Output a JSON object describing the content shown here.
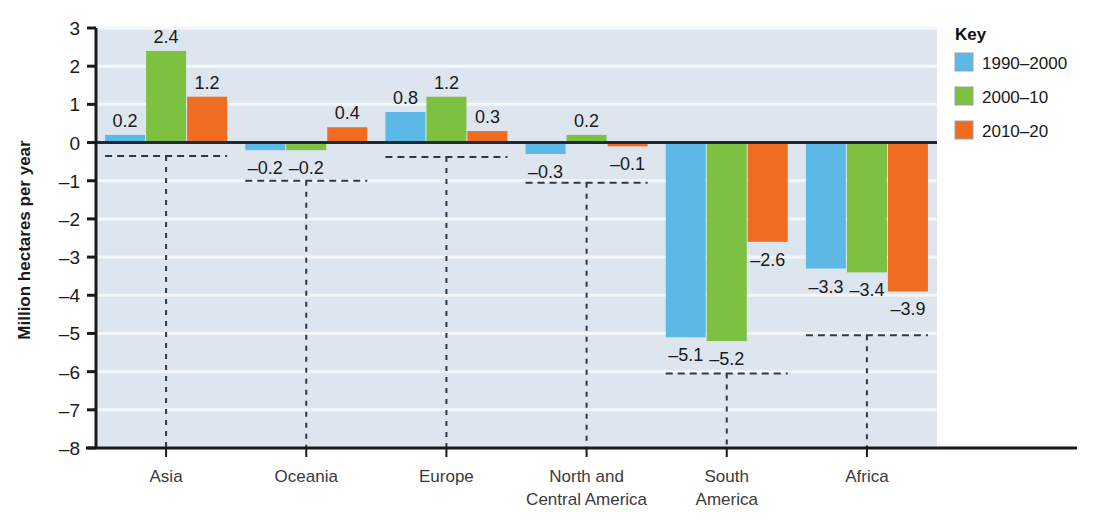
{
  "chart_data": {
    "type": "bar",
    "title": "",
    "xlabel": "",
    "ylabel": "Million hectares per year",
    "categories": [
      "Asia",
      "Oceania",
      "Europe",
      "North and Central America",
      "South America",
      "Africa"
    ],
    "category_lines": [
      [
        "Asia"
      ],
      [
        "Oceania"
      ],
      [
        "Europe"
      ],
      [
        "North and",
        "Central America"
      ],
      [
        "South",
        "America"
      ],
      [
        "Africa"
      ]
    ],
    "series": [
      {
        "name": "1990–2000",
        "color": "#5cb9e6",
        "values": [
          0.2,
          -0.2,
          0.8,
          -0.3,
          -5.1,
          -3.3
        ]
      },
      {
        "name": "2000–10",
        "color": "#7cc142",
        "values": [
          2.4,
          -0.2,
          1.2,
          0.2,
          -5.2,
          -3.4
        ]
      },
      {
        "name": "2010–20",
        "color": "#ef6c20",
        "values": [
          1.2,
          0.4,
          0.3,
          -0.1,
          -2.6,
          -3.9
        ]
      }
    ],
    "value_labels": [
      [
        "0.2",
        "2.4",
        "1.2"
      ],
      [
        "–0.2",
        "–0.2",
        "0.4"
      ],
      [
        "0.8",
        "1.2",
        "0.3"
      ],
      [
        "–0.3",
        "0.2",
        "–0.1"
      ],
      [
        "–5.1",
        "–5.2",
        "–2.6"
      ],
      [
        "–3.3",
        "–3.4",
        "–3.9"
      ]
    ],
    "ylim": [
      -8,
      3
    ],
    "ytick_values": [
      3,
      2,
      1,
      0,
      -1,
      -2,
      -3,
      -4,
      -5,
      -6,
      -7,
      -8
    ],
    "ytick_labels": [
      "3",
      "2",
      "1",
      "0",
      "–1",
      "–2",
      "–3",
      "–4",
      "–5",
      "–6",
      "–7",
      "–8"
    ],
    "grid": true,
    "plot_background": "#dde5ee",
    "gridline_color": "#f4f7fa",
    "zero_line_color": "#1c2a3a",
    "legend_position": "right"
  },
  "legend": {
    "title": "Key",
    "entries": [
      {
        "label": "1990–2000",
        "color": "#5cb9e6"
      },
      {
        "label": "2000–10",
        "color": "#7cc142"
      },
      {
        "label": "2010–20",
        "color": "#ef6c20"
      }
    ]
  }
}
